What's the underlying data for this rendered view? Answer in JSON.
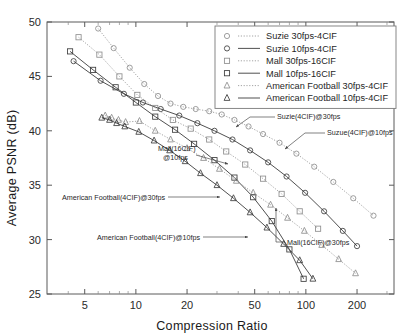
{
  "chart_data": {
    "type": "line",
    "title": "",
    "xlabel": "Compression Ratio",
    "ylabel": "Average PSNR (dB)",
    "xscale": "log",
    "yscale": "linear",
    "xlim": [
      3,
      330
    ],
    "ylim": [
      25,
      50
    ],
    "xticks": [
      5,
      10,
      20,
      50,
      100,
      200
    ],
    "xtick_labels": [
      "5",
      "10",
      "20",
      "50",
      "100",
      "200"
    ],
    "yticks": [
      25,
      30,
      35,
      40,
      45,
      50
    ],
    "ytick_labels": [
      "25",
      "30",
      "35",
      "40",
      "45",
      "50"
    ],
    "grid": false,
    "legend_position": "upper-right",
    "series": [
      {
        "name": "Suzie 30fps-4CIF",
        "marker": "circle",
        "linestyle": "dotted",
        "annotation": "Suzie(4CIF)@30fps",
        "points": [
          [
            6.0,
            49.4
          ],
          [
            7.4,
            47.6
          ],
          [
            9.2,
            45.8
          ],
          [
            11.2,
            44.3
          ],
          [
            13.5,
            43.2
          ],
          [
            16.0,
            42.5
          ],
          [
            19.0,
            42.2
          ],
          [
            22.5,
            42.0
          ],
          [
            27.0,
            41.8
          ],
          [
            32.0,
            41.5
          ],
          [
            38.0,
            41.0
          ],
          [
            46.0,
            40.4
          ],
          [
            56.0,
            39.7
          ],
          [
            70.0,
            38.9
          ],
          [
            88.0,
            37.9
          ],
          [
            112.0,
            36.7
          ],
          [
            145.0,
            35.3
          ],
          [
            190.0,
            33.8
          ],
          [
            250.0,
            32.2
          ]
        ]
      },
      {
        "name": "Suzie 10fps-4CIF",
        "marker": "circle",
        "linestyle": "solid",
        "annotation": "Suzue(4CIF)@10fps",
        "points": [
          [
            4.3,
            46.4
          ],
          [
            6.2,
            44.6
          ],
          [
            8.5,
            43.4
          ],
          [
            11.0,
            42.6
          ],
          [
            14.0,
            42.0
          ],
          [
            18.0,
            41.4
          ],
          [
            23.0,
            40.7
          ],
          [
            29.0,
            40.0
          ],
          [
            37.0,
            39.2
          ],
          [
            47.0,
            38.2
          ],
          [
            60.0,
            37.1
          ],
          [
            77.0,
            35.8
          ],
          [
            99.0,
            34.3
          ],
          [
            128.0,
            32.6
          ],
          [
            165.0,
            30.8
          ],
          [
            200.0,
            29.4
          ]
        ]
      },
      {
        "name": "Mall 30fps-16CIF",
        "marker": "square",
        "linestyle": "dotted",
        "annotation": "Mall(16CIF)@30fps",
        "points": [
          [
            4.6,
            48.6
          ],
          [
            6.1,
            47.0
          ],
          [
            8.0,
            45.0
          ],
          [
            10.2,
            43.3
          ],
          [
            13.0,
            42.1
          ],
          [
            16.5,
            41.0
          ],
          [
            21.0,
            40.2
          ],
          [
            27.0,
            39.2
          ],
          [
            34.0,
            38.1
          ],
          [
            44.0,
            36.9
          ],
          [
            56.0,
            35.6
          ],
          [
            72.0,
            34.2
          ],
          [
            92.0,
            32.6
          ],
          [
            118.0,
            31.0
          ]
        ]
      },
      {
        "name": "Mall 10fps-16CIF",
        "marker": "square",
        "linestyle": "solid",
        "annotation": "Mall(16CIF) @10fps",
        "points": [
          [
            4.1,
            47.3
          ],
          [
            5.6,
            45.6
          ],
          [
            7.6,
            44.0
          ],
          [
            10.0,
            42.6
          ],
          [
            13.0,
            41.3
          ],
          [
            17.0,
            40.1
          ],
          [
            22.0,
            38.8
          ],
          [
            29.0,
            37.3
          ],
          [
            38.0,
            35.7
          ],
          [
            49.0,
            33.9
          ],
          [
            63.0,
            31.7
          ],
          [
            80.0,
            29.1
          ],
          [
            97.0,
            26.4
          ]
        ]
      },
      {
        "name": "American Football 30fps-4CIF",
        "marker": "triangle",
        "linestyle": "dotted",
        "annotation": "American Football(4CIF)@30fps",
        "points": [
          [
            6.6,
            41.4
          ],
          [
            7.2,
            41.2
          ],
          [
            7.9,
            41.0
          ],
          [
            8.7,
            40.8
          ],
          [
            10.5,
            40.9
          ],
          [
            13.0,
            40.0
          ],
          [
            16.0,
            39.2
          ],
          [
            20.0,
            38.4
          ],
          [
            25.0,
            37.5
          ],
          [
            31.0,
            36.5
          ],
          [
            39.0,
            35.4
          ],
          [
            49.0,
            34.3
          ],
          [
            62.0,
            33.2
          ],
          [
            78.0,
            32.0
          ],
          [
            98.0,
            30.8
          ],
          [
            124.0,
            29.5
          ],
          [
            156.0,
            28.2
          ],
          [
            196.0,
            26.9
          ]
        ]
      },
      {
        "name": "American Football 10fps-4CIF",
        "marker": "triangle",
        "linestyle": "solid",
        "annotation": "American Football(4CIF) @10fps",
        "points": [
          [
            6.3,
            41.2
          ],
          [
            7.0,
            41.0
          ],
          [
            7.7,
            40.7
          ],
          [
            8.6,
            40.4
          ],
          [
            10.4,
            39.9
          ],
          [
            12.8,
            39.1
          ],
          [
            15.8,
            38.2
          ],
          [
            19.5,
            37.2
          ],
          [
            24.0,
            36.1
          ],
          [
            30.0,
            35.0
          ],
          [
            37.5,
            33.8
          ],
          [
            47.0,
            32.5
          ],
          [
            59.0,
            31.1
          ],
          [
            74.0,
            29.6
          ],
          [
            92.0,
            28.1
          ],
          [
            110.0,
            26.4
          ]
        ]
      }
    ],
    "annotations": [
      "Suzie(4CIF)@30fps",
      "Suzue(4CIF)@10fps",
      "Mall(16CIF) @10fps",
      "Mall(16CIF)@30fps",
      "American Football(4CIF)@30fps",
      "American Football(4CIF) @10fps"
    ]
  },
  "legend": {
    "items": [
      {
        "label": "Suzie 30fps-4CIF",
        "marker": "circle",
        "linestyle": "dotted"
      },
      {
        "label": "Suzie 10fps-4CIF",
        "marker": "circle",
        "linestyle": "solid"
      },
      {
        "label": "Mall 30fps-16CIF",
        "marker": "square",
        "linestyle": "dotted"
      },
      {
        "label": "Mall 10fps-16CIF",
        "marker": "square",
        "linestyle": "solid"
      },
      {
        "label": "American Football 30fps-4CIF",
        "marker": "triangle",
        "linestyle": "dotted"
      },
      {
        "label": "American Football 10fps-4CIF",
        "marker": "triangle",
        "linestyle": "solid"
      }
    ]
  },
  "annotation_labels": {
    "suzie_30": "Suzie(4CIF)@30fps",
    "suzie_10": "Suzue(4CIF)@10fps",
    "mall_10_line1": "Mall(16CIF)",
    "mall_10_line2": "@10fps",
    "mall_30": "Mall(16CIF)@30fps",
    "af_30": "American Football(4CIF)@30fps",
    "af_10": "American Football(4CIF)@10fps"
  },
  "colors": {
    "solid_line": "#3c3c3c",
    "dotted_line": "#9a9a9a",
    "frame": "#5a5a5a",
    "text": "#1a1a1a",
    "background": "#ffffff"
  }
}
